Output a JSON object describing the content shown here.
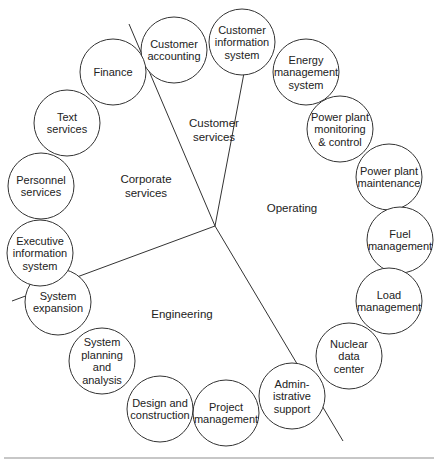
{
  "diagram": {
    "type": "radial-organization",
    "center": {
      "x": 215,
      "y": 226
    },
    "dividers": [
      {
        "name": "corporate-customer-divider",
        "x2": 129,
        "y2": 24
      },
      {
        "name": "customer-operating-divider",
        "x2": 255,
        "y2": 15
      },
      {
        "name": "corporate-engineering-divider",
        "x2": 12,
        "y2": 301
      },
      {
        "name": "engineering-operating-divider",
        "x2": 343,
        "y2": 441
      }
    ],
    "sectors": [
      {
        "name": "Corporate services",
        "lines": [
          "Corporate",
          "services"
        ],
        "x": 146,
        "y": 186
      },
      {
        "name": "Customer services",
        "lines": [
          "Customer",
          "services"
        ],
        "x": 214,
        "y": 130
      },
      {
        "name": "Operating",
        "lines": [
          "Operating"
        ],
        "x": 292,
        "y": 208
      },
      {
        "name": "Engineering",
        "lines": [
          "Engineering"
        ],
        "x": 182,
        "y": 314
      }
    ],
    "nodes": [
      {
        "name": "Customer accounting",
        "sector": "Customer services",
        "lines": [
          "Customer",
          "accounting"
        ],
        "x": 174,
        "y": 50
      },
      {
        "name": "Customer information system",
        "sector": "Customer services",
        "lines": [
          "Customer",
          "information",
          "system"
        ],
        "x": 242,
        "y": 42
      },
      {
        "name": "Energy management system",
        "sector": "Operating",
        "lines": [
          "Energy",
          "management",
          "system"
        ],
        "x": 306,
        "y": 72
      },
      {
        "name": "Power plant monitoring & control",
        "sector": "Operating",
        "lines": [
          "Power plant",
          "monitoring",
          "& control"
        ],
        "x": 340,
        "y": 129
      },
      {
        "name": "Power plant maintenance",
        "sector": "Operating",
        "lines": [
          "Power plant",
          "maintenance"
        ],
        "x": 389,
        "y": 177
      },
      {
        "name": "Fuel management",
        "sector": "Operating",
        "lines": [
          "Fuel",
          "management"
        ],
        "x": 400,
        "y": 240
      },
      {
        "name": "Load management",
        "sector": "Operating",
        "lines": [
          "Load",
          "management"
        ],
        "x": 389,
        "y": 301
      },
      {
        "name": "Nuclear data center",
        "sector": "Operating",
        "lines": [
          "Nuclear",
          "data",
          "center"
        ],
        "x": 349,
        "y": 356
      },
      {
        "name": "Administrative support",
        "sector": "Operating",
        "lines": [
          "Admin-",
          "istrative",
          "support"
        ],
        "x": 292,
        "y": 396
      },
      {
        "name": "Project management",
        "sector": "Engineering",
        "lines": [
          "Project",
          "management"
        ],
        "x": 226,
        "y": 413
      },
      {
        "name": "Design and construction",
        "sector": "Engineering",
        "lines": [
          "Design and",
          "construction"
        ],
        "x": 160,
        "y": 409
      },
      {
        "name": "System planning and analysis",
        "sector": "Engineering",
        "lines": [
          "System",
          "planning",
          "and",
          "analysis"
        ],
        "x": 102,
        "y": 361
      },
      {
        "name": "System expansion",
        "sector": "Engineering",
        "lines": [
          "System",
          "expansion"
        ],
        "x": 58,
        "y": 302
      },
      {
        "name": "Executive information system",
        "sector": "Corporate services",
        "lines": [
          "Executive",
          "information",
          "system"
        ],
        "x": 40,
        "y": 253
      },
      {
        "name": "Personnel services",
        "sector": "Corporate services",
        "lines": [
          "Personnel",
          "services"
        ],
        "x": 41,
        "y": 186
      },
      {
        "name": "Text services",
        "sector": "Corporate services",
        "lines": [
          "Text",
          "services"
        ],
        "x": 67,
        "y": 123
      },
      {
        "name": "Finance",
        "sector": "Corporate services",
        "lines": [
          "Finance"
        ],
        "x": 113,
        "y": 72
      }
    ],
    "node_radius": 33,
    "line_height": 12.5,
    "colors": {
      "stroke": "#333333",
      "text": "#222222",
      "background": "#ffffff",
      "rule": "#b5b5b5"
    }
  }
}
